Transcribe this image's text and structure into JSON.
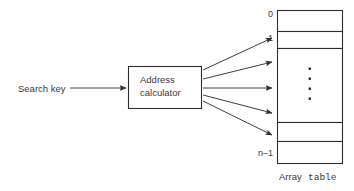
{
  "figure": {
    "input": {
      "label": "Search key"
    },
    "processor": {
      "line1": "Address",
      "line2": "calculator"
    },
    "table": {
      "index_first": "0",
      "index_second": "1",
      "index_last": "n–1",
      "ellipsis": "⋮",
      "caption_word": "Array",
      "caption_code": "table",
      "row_count": 5
    },
    "arrows": {
      "input_arrow_name": "search-key-arrow",
      "fan_count": 5
    },
    "colors": {
      "stroke": "#2e2e2e",
      "text": "#3a3a3a",
      "background": "#ffffff"
    }
  }
}
